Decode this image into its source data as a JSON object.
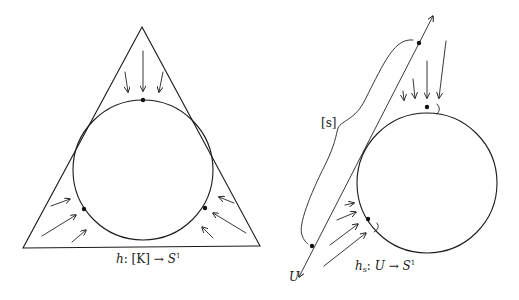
{
  "figure": {
    "left": {
      "caption": {
        "func": "h",
        "colon": ":",
        "domain": "[K]",
        "arrow": "→",
        "codomain": "S",
        "codomain_sup": "1"
      },
      "shapes": {
        "triangle": "equilateral triangle circumscribing circle",
        "circle": "inscribed circle S^1",
        "marked_points": 3,
        "arrow_groups": [
          "top (3 arrows, pointing down)",
          "lower-left (3 arrows, pointing up-right)",
          "lower-right (3 arrows, pointing up-left)"
        ]
      }
    },
    "right": {
      "caption": {
        "func": "h",
        "func_sub": "s",
        "colon": ":",
        "domain": "U",
        "arrow": "→",
        "codomain": "S",
        "codomain_sup": "1"
      },
      "brace_label": "[s]",
      "line_label": "U",
      "shapes": {
        "line": "tangent line U with arrows on both ends",
        "circle": "circle S^1",
        "marked_points": 4,
        "arrow_groups": [
          "top (4 arrows, pointing down)",
          "lower-left (4 arrows, pointing up-right)"
        ]
      }
    }
  }
}
